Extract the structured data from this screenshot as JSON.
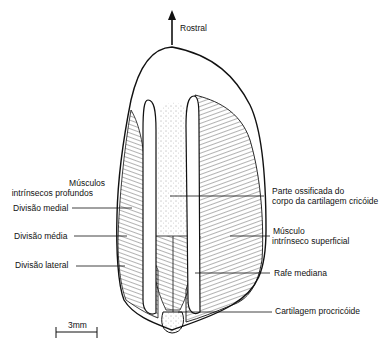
{
  "diagram": {
    "orientation_label": "Rostral",
    "labels_left": {
      "deep_muscles_line1": "Músculos",
      "deep_muscles_line2": "intrínsecos profundos",
      "medial": "Divisão medial",
      "middle": "Divisão média",
      "lateral": "Divisão lateral"
    },
    "labels_right": {
      "ossified_line1": "Parte ossificada do",
      "ossified_line2": "corpo da cartilagem cricóide",
      "superficial_line1": "Músculo",
      "superficial_line2": "intrínseco superficial",
      "raphe": "Rafe mediana",
      "procricoid": "Cartilagem procricóide"
    },
    "scale_bar": {
      "label": "3mm"
    },
    "colors": {
      "ink": "#111111",
      "background": "#ffffff"
    }
  }
}
